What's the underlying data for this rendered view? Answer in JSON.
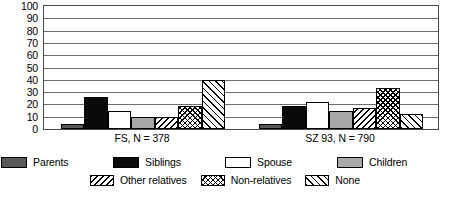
{
  "chart_data": {
    "type": "bar",
    "title": "",
    "subtitle": "",
    "xlabel": "",
    "ylabel": "",
    "ylim": [
      0,
      100
    ],
    "ytick_step": 10,
    "yticks": [
      100,
      90,
      80,
      70,
      60,
      50,
      40,
      30,
      20,
      10,
      0
    ],
    "grid": true,
    "legend_position": "bottom",
    "categories": [
      "FS, N = 378",
      "SZ 93, N = 790"
    ],
    "series": [
      {
        "name": "Parents",
        "pattern": "solid-dark-gray",
        "color": "#595959",
        "values": [
          4,
          4
        ]
      },
      {
        "name": "Siblings",
        "pattern": "solid-black",
        "color": "#0a0a0a",
        "values": [
          26,
          19
        ]
      },
      {
        "name": "Spouse",
        "pattern": "solid-white",
        "color": "#ffffff",
        "values": [
          15,
          22
        ]
      },
      {
        "name": "Children",
        "pattern": "solid-light-gray",
        "color": "#a8a8a8",
        "values": [
          10,
          15
        ]
      },
      {
        "name": "Other relatives",
        "pattern": "backslash-hatch",
        "color": "#ffffff",
        "values": [
          10,
          17
        ]
      },
      {
        "name": "Non-relatives",
        "pattern": "crosshatch",
        "color": "#ffffff",
        "values": [
          19,
          33
        ]
      },
      {
        "name": "None",
        "pattern": "slash-hatch",
        "color": "#ffffff",
        "values": [
          40,
          12
        ]
      }
    ]
  },
  "axis": {
    "yticks": [
      "100",
      "90",
      "80",
      "70",
      "60",
      "50",
      "40",
      "30",
      "20",
      "10",
      "0"
    ],
    "xticks": [
      "FS, N = 378",
      "SZ 93, N = 790"
    ]
  },
  "legend": {
    "row1": [
      {
        "label": "Parents",
        "swatch": "solid-dark-gray-swatch"
      },
      {
        "label": "Siblings",
        "swatch": "solid-black-swatch"
      },
      {
        "label": "Spouse",
        "swatch": "solid-white-swatch"
      },
      {
        "label": "Children",
        "swatch": "solid-light-gray-swatch"
      }
    ],
    "row2": [
      {
        "label": "Other relatives",
        "swatch": "backslash-hatch-swatch"
      },
      {
        "label": "Non-relatives",
        "swatch": "crosshatch-swatch"
      },
      {
        "label": "None",
        "swatch": "slash-hatch-swatch"
      }
    ]
  }
}
